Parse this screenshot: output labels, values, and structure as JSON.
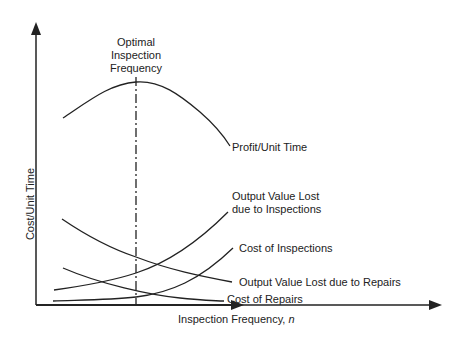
{
  "diagram": {
    "type": "conceptual-line-diagram",
    "x_axis_label": "Inspection Frequency, ",
    "x_axis_var": "n",
    "y_axis_label": "Cost/Unit Time",
    "optimal_marker": {
      "line1": "Optimal",
      "line2": "Inspection",
      "line3": "Frequency",
      "style": "dash-dot vertical line"
    },
    "curves": [
      {
        "id": "profit",
        "label": "Profit/Unit Time",
        "shape": "concave, peak at optimal frequency"
      },
      {
        "id": "output-lost-inspections",
        "label_line1": "Output Value Lost",
        "label_line2": "due to Inspections",
        "shape": "increasing, convex"
      },
      {
        "id": "cost-inspections",
        "label": "Cost of Inspections",
        "shape": "increasing, convex"
      },
      {
        "id": "output-lost-repairs",
        "label": "Output Value Lost due to Repairs",
        "shape": "decreasing"
      },
      {
        "id": "cost-repairs",
        "label": "Cost of Repairs",
        "shape": "decreasing"
      }
    ],
    "colors": {
      "line": "#222222",
      "background": "#ffffff"
    }
  }
}
